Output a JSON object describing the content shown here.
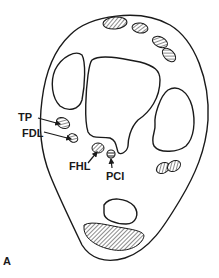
{
  "figure": {
    "panel_label": "A",
    "labels": {
      "tp": "TP",
      "fdl": "FDL",
      "fhl": "FHL",
      "pci": "PCI"
    },
    "colors": {
      "line": "#1a1a1a",
      "background": "#ffffff"
    }
  }
}
